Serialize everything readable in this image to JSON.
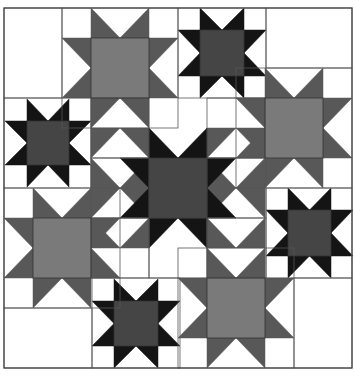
{
  "colors": {
    "background": "#ffffff",
    "line": "#555555",
    "black_arm": "#141414",
    "black_center": "#454545",
    "gray_arm": "#585858",
    "gray_center": "#7a7a7a"
  },
  "bounds": {
    "x0": 4,
    "y0": 8,
    "x1": 352,
    "y1": 368
  },
  "blocks": [
    {
      "x": 4,
      "y": 8,
      "w": 58,
      "h": 90
    },
    {
      "x": 62,
      "y": 8,
      "w": 116,
      "h": 120
    },
    {
      "x": 178,
      "y": 8,
      "w": 88,
      "h": 90
    },
    {
      "x": 266,
      "y": 8,
      "w": 86,
      "h": 60
    },
    {
      "x": 4,
      "y": 98,
      "w": 87,
      "h": 90
    },
    {
      "x": 91,
      "y": 98,
      "w": 58,
      "h": 60
    },
    {
      "x": 207,
      "y": 98,
      "w": 58,
      "h": 60
    },
    {
      "x": 236,
      "y": 68,
      "w": 116,
      "h": 120
    },
    {
      "x": 91,
      "y": 158,
      "w": 58,
      "h": 60
    },
    {
      "x": 207,
      "y": 158,
      "w": 59,
      "h": 60
    },
    {
      "x": 4,
      "y": 188,
      "w": 116,
      "h": 120
    },
    {
      "x": 91,
      "y": 218,
      "w": 58,
      "h": 60
    },
    {
      "x": 149,
      "y": 218,
      "w": 58,
      "h": 60
    },
    {
      "x": 207,
      "y": 218,
      "w": 59,
      "h": 60
    },
    {
      "x": 266,
      "y": 188,
      "w": 86,
      "h": 90
    },
    {
      "x": 4,
      "y": 308,
      "w": 88,
      "h": 60
    },
    {
      "x": 92,
      "y": 278,
      "w": 88,
      "h": 90
    },
    {
      "x": 178,
      "y": 248,
      "w": 116,
      "h": 120
    },
    {
      "x": 294,
      "y": 278,
      "w": 58,
      "h": 90
    }
  ],
  "stars": [
    {
      "name": "gray-star-top",
      "tone": "gray",
      "cx0": 91,
      "cy0": 38,
      "cx1": 149,
      "cy1": 98,
      "ax": 29,
      "ay": 30
    },
    {
      "name": "black-star-top",
      "tone": "black",
      "cx0": 200,
      "cy0": 30,
      "cx1": 244,
      "cy1": 76,
      "ax": 22,
      "ay": 22
    },
    {
      "name": "black-star-left",
      "tone": "black",
      "cx0": 27,
      "cy0": 121,
      "cx1": 69,
      "cy1": 165,
      "ax": 22,
      "ay": 22
    },
    {
      "name": "gray-star-right",
      "tone": "gray",
      "cx0": 265,
      "cy0": 98,
      "cx1": 323,
      "cy1": 158,
      "ax": 29,
      "ay": 30
    },
    {
      "name": "black-star-center-large",
      "tone": "black",
      "cx0": 149,
      "cy0": 158,
      "cx1": 207,
      "cy1": 218,
      "ax": 29,
      "ay": 30
    },
    {
      "name": "gray-star-bottom-left",
      "tone": "gray",
      "cx0": 33,
      "cy0": 218,
      "cx1": 91,
      "cy1": 278,
      "ax": 29,
      "ay": 30
    },
    {
      "name": "black-star-right",
      "tone": "black",
      "cx0": 288,
      "cy0": 210,
      "cx1": 331,
      "cy1": 256,
      "ax": 22,
      "ay": 22
    },
    {
      "name": "black-star-bottom",
      "tone": "black",
      "cx0": 114,
      "cy0": 301,
      "cx1": 158,
      "cy1": 346,
      "ax": 22,
      "ay": 22
    },
    {
      "name": "gray-star-bottom-right",
      "tone": "gray",
      "cx0": 207,
      "cy0": 278,
      "cx1": 265,
      "cy1": 338,
      "ax": 29,
      "ay": 30
    }
  ],
  "square_in_square": [
    {
      "x": 91,
      "y": 128,
      "w": 58,
      "h": 60,
      "tone": "gray"
    },
    {
      "x": 207,
      "y": 128,
      "w": 58,
      "h": 60,
      "tone": "gray"
    },
    {
      "x": 91,
      "y": 188,
      "w": 58,
      "h": 60,
      "tone": "gray"
    },
    {
      "x": 207,
      "y": 188,
      "w": 58,
      "h": 60,
      "tone": "gray"
    }
  ]
}
